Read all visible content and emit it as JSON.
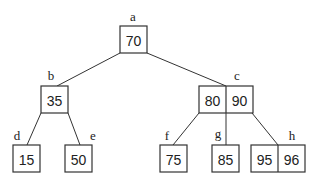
{
  "diagram": {
    "type": "b-tree",
    "nodes": [
      {
        "id": "a",
        "label": "a",
        "keys": [
          "70"
        ],
        "x": 120,
        "y": 26,
        "label_x": 133,
        "label_y": 21
      },
      {
        "id": "b",
        "label": "b",
        "keys": [
          "35"
        ],
        "x": 41,
        "y": 86,
        "label_x": 51,
        "label_y": 80
      },
      {
        "id": "c",
        "label": "c",
        "keys": [
          "80",
          "90"
        ],
        "x": 199,
        "y": 86,
        "label_x": 237,
        "label_y": 80
      },
      {
        "id": "d",
        "label": "d",
        "keys": [
          "15"
        ],
        "x": 13,
        "y": 145,
        "label_x": 17,
        "label_y": 140
      },
      {
        "id": "e",
        "label": "e",
        "keys": [
          "50"
        ],
        "x": 65,
        "y": 145,
        "label_x": 93,
        "label_y": 140
      },
      {
        "id": "f",
        "label": "f",
        "keys": [
          "75"
        ],
        "x": 160,
        "y": 145,
        "label_x": 167,
        "label_y": 140
      },
      {
        "id": "g",
        "label": "g",
        "keys": [
          "85"
        ],
        "x": 212,
        "y": 145,
        "label_x": 218,
        "label_y": 138
      },
      {
        "id": "h",
        "label": "h",
        "keys": [
          "95",
          "96"
        ],
        "x": 251,
        "y": 145,
        "label_x": 292,
        "label_y": 140
      }
    ],
    "edges": [
      {
        "from": "a",
        "to": "b",
        "x1": 120,
        "y1": 53,
        "x2": 57,
        "y2": 86
      },
      {
        "from": "a",
        "to": "c",
        "x1": 147,
        "y1": 53,
        "x2": 226,
        "y2": 86
      },
      {
        "from": "b",
        "to": "d",
        "x1": 41,
        "y1": 113,
        "x2": 27,
        "y2": 145
      },
      {
        "from": "b",
        "to": "e",
        "x1": 68,
        "y1": 113,
        "x2": 80,
        "y2": 145
      },
      {
        "from": "c",
        "to": "f",
        "x1": 199,
        "y1": 113,
        "x2": 173,
        "y2": 145
      },
      {
        "from": "c",
        "to": "g",
        "x1": 226,
        "y1": 113,
        "x2": 226,
        "y2": 145
      },
      {
        "from": "c",
        "to": "h",
        "x1": 252,
        "y1": 113,
        "x2": 278,
        "y2": 145
      }
    ],
    "cell_width": 27,
    "cell_height": 27
  }
}
